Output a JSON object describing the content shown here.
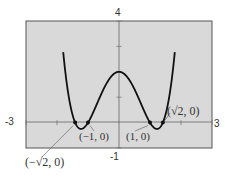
{
  "chart_data": {
    "type": "line",
    "title": "",
    "function": "f(x) = x^4 - 3x^2 + 2",
    "xlabel": "",
    "ylabel": "",
    "xlim": [
      -3,
      3
    ],
    "ylim": [
      -1,
      4
    ],
    "grid": false,
    "tick_labels": {
      "x_min": "-3",
      "x_max": "3",
      "y_min": "-1",
      "y_max": "4"
    },
    "series": [
      {
        "name": "f(x)",
        "x": [
          -1.77,
          -1.7,
          -1.6,
          -1.5,
          -1.414,
          -1.3,
          -1.225,
          -1.1,
          -1.0,
          -0.8,
          -0.6,
          -0.4,
          -0.2,
          0,
          0.2,
          0.4,
          0.6,
          0.8,
          1.0,
          1.1,
          1.225,
          1.3,
          1.414,
          1.5,
          1.6,
          1.7,
          1.77
        ],
        "values": [
          4.42,
          2.68,
          1.87,
          0.31,
          0.0,
          -0.15,
          -0.25,
          -0.2,
          0.0,
          0.49,
          1.05,
          1.54,
          1.88,
          2.0,
          1.88,
          1.54,
          1.05,
          0.49,
          0.0,
          -0.2,
          -0.25,
          -0.15,
          0.0,
          0.31,
          1.87,
          2.68,
          4.42
        ]
      }
    ],
    "points": [
      {
        "label": "(−√2, 0)",
        "x": -1.414,
        "y": 0
      },
      {
        "label": "(−1, 0)",
        "x": -1,
        "y": 0
      },
      {
        "label": "(1, 0)",
        "x": 1,
        "y": 0
      },
      {
        "label": "(√2, 0)",
        "x": 1.414,
        "y": 0
      }
    ],
    "annotations": [
      "(−√2, 0)",
      "(−1, 0)",
      "(1, 0)",
      "(√2, 0)"
    ],
    "colors": {
      "plot_background": "#d9d9d9",
      "frame": "#555555",
      "curve": "#111111",
      "axes": "#666666"
    }
  }
}
